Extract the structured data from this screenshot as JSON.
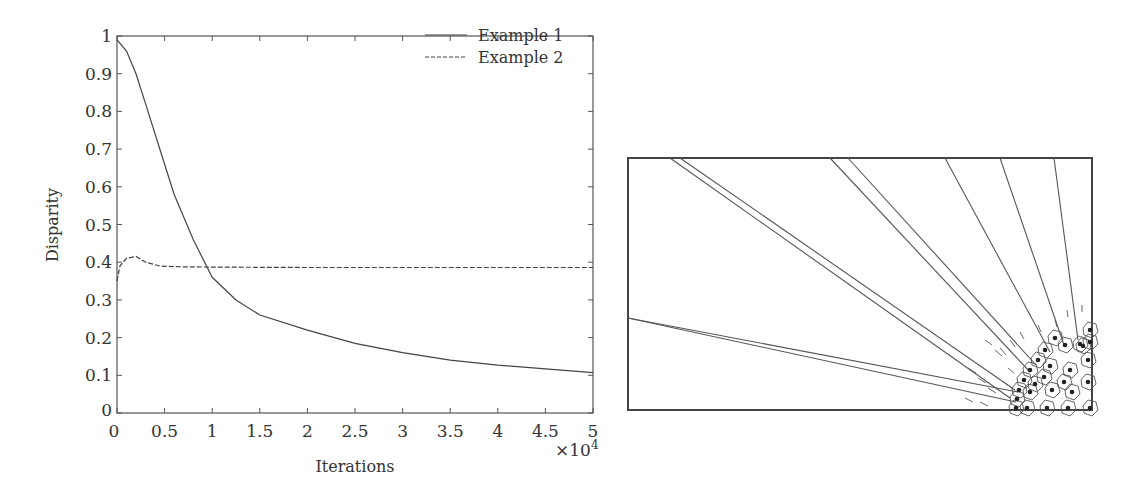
{
  "chart_data": [
    {
      "type": "line",
      "title": "",
      "xlabel": "Iterations",
      "ylabel": "Disparity",
      "x_multiplier": "×10^4",
      "xlim": [
        0,
        5
      ],
      "ylim": [
        0,
        1
      ],
      "xticks": [
        "0",
        "0.5",
        "1",
        "1.5",
        "2",
        "2.5",
        "3",
        "3.5",
        "4",
        "4.5",
        "5"
      ],
      "yticks": [
        "0",
        "0.1",
        "0.2",
        "0.3",
        "0.4",
        "0.5",
        "0.6",
        "0.7",
        "0.8",
        "0.9",
        "1"
      ],
      "legend_position": "upper right",
      "series": [
        {
          "name": "Example 1",
          "style": "solid",
          "x": [
            0,
            0.1,
            0.2,
            0.3,
            0.5,
            0.6,
            0.8,
            1.0,
            1.25,
            1.5,
            2.0,
            2.5,
            3.0,
            3.5,
            4.0,
            4.5,
            5.0
          ],
          "y": [
            0.99,
            0.96,
            0.9,
            0.82,
            0.66,
            0.58,
            0.46,
            0.36,
            0.3,
            0.26,
            0.22,
            0.185,
            0.16,
            0.14,
            0.127,
            0.117,
            0.107
          ]
        },
        {
          "name": "Example 2",
          "style": "dashed",
          "x": [
            0,
            0.03,
            0.1,
            0.2,
            0.3,
            0.45,
            0.6,
            1.0,
            2.0,
            3.0,
            4.0,
            5.0
          ],
          "y": [
            0.35,
            0.39,
            0.41,
            0.415,
            0.4,
            0.39,
            0.388,
            0.387,
            0.386,
            0.386,
            0.386,
            0.386
          ]
        }
      ]
    },
    {
      "type": "diagram",
      "description": "Voronoi cell cluster at bottom-right corner with radial lines fanning out to upper-left and small arrows pointing toward cluster"
    }
  ],
  "legend": {
    "items": [
      "Example 1",
      "Example 2"
    ]
  },
  "axes": {
    "xlabel": "Iterations",
    "ylabel": "Disparity",
    "multiplier_base": "×10",
    "multiplier_exp": "4"
  }
}
